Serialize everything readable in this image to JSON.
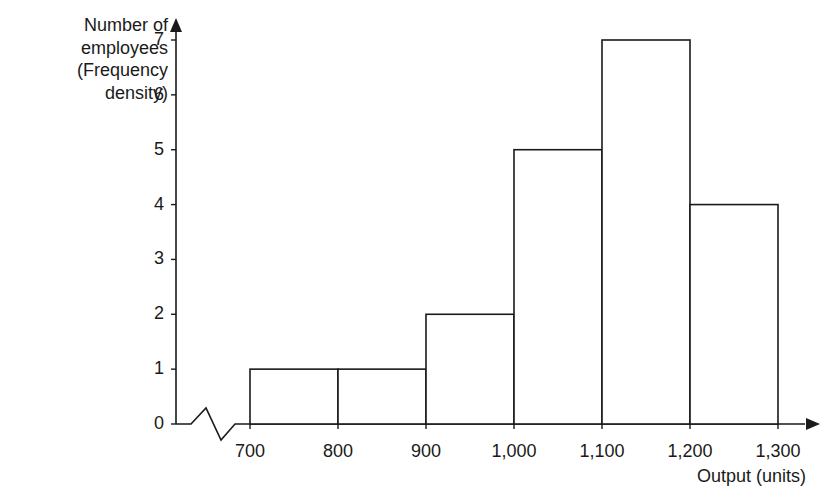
{
  "chart_data": {
    "type": "bar",
    "subtype": "histogram",
    "title": "",
    "xlabel": "Output (units)",
    "ylabel": [
      "Number of",
      "employees",
      "(Frequency",
      "density)"
    ],
    "ylabel_text": "Number of employees (Frequency density)",
    "bins": [
      {
        "from": 700,
        "to": 800,
        "value": 1
      },
      {
        "from": 800,
        "to": 900,
        "value": 1
      },
      {
        "from": 900,
        "to": 1000,
        "value": 2
      },
      {
        "from": 1000,
        "to": 1100,
        "value": 5
      },
      {
        "from": 1100,
        "to": 1200,
        "value": 7
      },
      {
        "from": 1200,
        "to": 1300,
        "value": 4
      }
    ],
    "categories": [
      "700-800",
      "800-900",
      "900-1,000",
      "1,000-1,100",
      "1,100-1,200",
      "1,200-1,300"
    ],
    "values": [
      1,
      1,
      2,
      5,
      7,
      4
    ],
    "x_ticks": [
      "700",
      "800",
      "900",
      "1,000",
      "1,100",
      "1,200",
      "1,300"
    ],
    "y_ticks": [
      "0",
      "1",
      "2",
      "3",
      "4",
      "5",
      "6",
      "7"
    ],
    "xlim": [
      700,
      1300
    ],
    "ylim": [
      0,
      7
    ],
    "x_axis_break": true,
    "grid": false,
    "legend": null,
    "bar_fill": "#ffffff",
    "bar_stroke": "#1a1a1a"
  }
}
